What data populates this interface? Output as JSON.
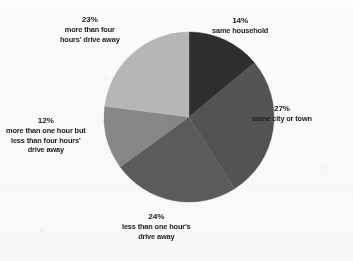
{
  "figure": {
    "background_color": "#fcfcfc",
    "text_color": "#1c1c1c"
  },
  "chart_data": {
    "type": "pie",
    "title": "",
    "subtitle": "",
    "xlabel": "",
    "ylabel": "",
    "legend_position": "none",
    "grid": false,
    "start_angle_deg": 0,
    "direction": "clockwise",
    "center": {
      "x": 189,
      "y": 117
    },
    "radius": 85,
    "units": "percent",
    "categories": [
      "same household",
      "same city or town",
      "less than one hour's drive away",
      "more than one hour but less than four hours' drive away",
      "more than four hours' drive away"
    ],
    "values": [
      14,
      27,
      24,
      12,
      23
    ],
    "colors": [
      "#2e2e2e",
      "#545454",
      "#5c5c5c",
      "#888888",
      "#b8b8b8"
    ],
    "slices": [
      {
        "id": "same-household",
        "percent_label": "14%",
        "description_lines": [
          "same household"
        ],
        "value": 14,
        "color": "#2e2e2e",
        "start_deg": 0,
        "end_deg": 50.4
      },
      {
        "id": "same-city-or-town",
        "percent_label": "27%",
        "description_lines": [
          "same city or town"
        ],
        "value": 27,
        "color": "#545454",
        "start_deg": 50.4,
        "end_deg": 147.6
      },
      {
        "id": "less-than-one-hour",
        "percent_label": "24%",
        "description_lines": [
          "less than one hour's",
          "drive away"
        ],
        "value": 24,
        "color": "#5c5c5c",
        "start_deg": 147.6,
        "end_deg": 234.0
      },
      {
        "id": "one-to-four-hours",
        "percent_label": "12%",
        "description_lines": [
          "more than one hour but",
          "less than four hours'",
          "drive away"
        ],
        "value": 12,
        "color": "#888888",
        "start_deg": 234.0,
        "end_deg": 277.2
      },
      {
        "id": "more-than-four-hours",
        "percent_label": "23%",
        "description_lines": [
          "more than four",
          "hours' drive away"
        ],
        "value": 23,
        "color": "#b8b8b8",
        "start_deg": 277.2,
        "end_deg": 360.0
      }
    ]
  },
  "labels": {
    "same_household": {
      "pct": "14%",
      "line1": "same household"
    },
    "same_city": {
      "pct": "27%",
      "line1": "same city or town"
    },
    "less_one_hour": {
      "pct": "24%",
      "line1": "less than one hour's",
      "line2": "drive away"
    },
    "one_to_four": {
      "pct": "12%",
      "line1": "more than one hour but",
      "line2": "less than four hours'",
      "line3": "drive away"
    },
    "more_four": {
      "pct": "23%",
      "line1": "more than four",
      "line2": "hours' drive away"
    }
  }
}
